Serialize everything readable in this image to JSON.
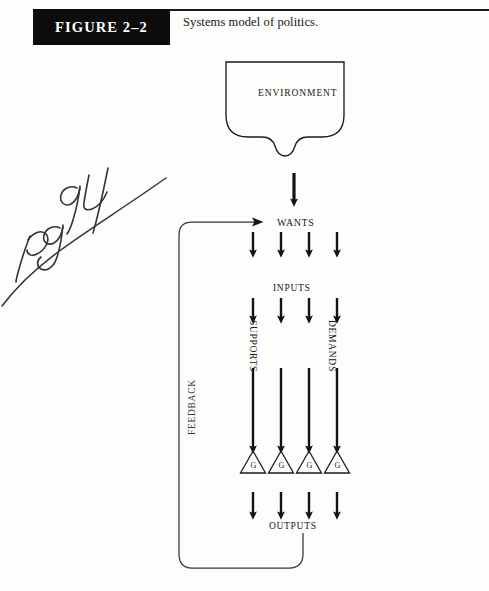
{
  "page": {
    "background_color": "#fdfdfc",
    "width": 489,
    "height": 591
  },
  "header": {
    "figure_tag": "FIGURE 2–2",
    "figure_tag_bg": "#0c0c0c",
    "figure_tag_color": "#ffffff",
    "caption": "Systems model of politics."
  },
  "annotation": {
    "handwritten_note": "pg 94",
    "ink_color": "#2f2f3a"
  },
  "diagram": {
    "type": "flow-diagram",
    "line_color": "#1a1a1a",
    "nodes": {
      "environment": "ENVIRONMENT",
      "wants": "WANTS",
      "inputs": "INPUTS",
      "supports": "SUPPORTS",
      "demands": "DEMANDS",
      "outputs": "OUTPUTS",
      "feedback": "FEEDBACK"
    },
    "gates": {
      "symbol": "triangle",
      "label": "G",
      "count": 4
    },
    "arrow_columns": [
      253,
      281,
      309,
      337
    ],
    "flow_order": [
      "ENVIRONMENT",
      "WANTS",
      "INPUTS",
      "SUPPORTS",
      "DEMANDS",
      "G",
      "OUTPUTS",
      "FEEDBACK"
    ]
  }
}
